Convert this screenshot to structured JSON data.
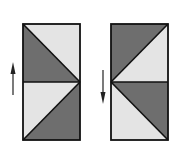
{
  "colors": {
    "background": "#ffffff",
    "dark": "#6e6e6e",
    "light": "#e4e4e4",
    "stroke": "#111111"
  },
  "panels": [
    {
      "name": "left-panel",
      "arrow": "up",
      "top_square": {
        "dark": "lower-left",
        "light": "upper-right",
        "diagonal": "top-left to bottom-right"
      },
      "bottom_square": {
        "dark": "lower-right",
        "light": "upper-left",
        "diagonal": "top-right to bottom-left"
      }
    },
    {
      "name": "right-panel",
      "arrow": "down",
      "top_square": {
        "dark": "upper-left",
        "light": "lower-right",
        "diagonal": "bottom-left to top-right"
      },
      "bottom_square": {
        "dark": "upper-right",
        "light": "lower-left",
        "diagonal": "top-left to bottom-right"
      }
    }
  ]
}
